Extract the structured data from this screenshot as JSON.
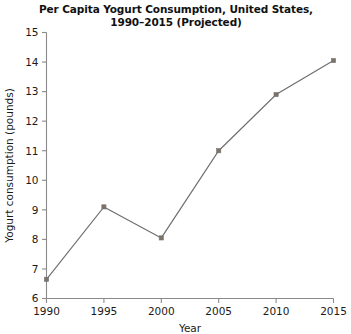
{
  "chart_data": {
    "type": "line",
    "title": "Per Capita Yogurt Consumption, United States,\n1990–2015 (Projected)",
    "xlabel": "Year",
    "ylabel": "Yogurt consumption (pounds)",
    "x": [
      1990,
      1995,
      2000,
      2005,
      2010,
      2015
    ],
    "xticklabels": [
      "1990",
      "1995",
      "2000",
      "2005",
      "2010",
      "2015"
    ],
    "values": [
      6.65,
      9.1,
      8.05,
      11.0,
      12.9,
      14.05
    ],
    "yticks": [
      6,
      7,
      8,
      9,
      10,
      11,
      12,
      13,
      14,
      15
    ],
    "yticklabels": [
      "6",
      "7",
      "8",
      "9",
      "10",
      "11",
      "12",
      "13",
      "14",
      "15"
    ],
    "xlim": [
      1990,
      2015
    ],
    "ylim": [
      6,
      15
    ],
    "grid": false,
    "legend": false,
    "line_color": "#6e6e6e",
    "marker_color": "#7a736b",
    "marker": "square",
    "axis_color": "#8a8a8a"
  }
}
